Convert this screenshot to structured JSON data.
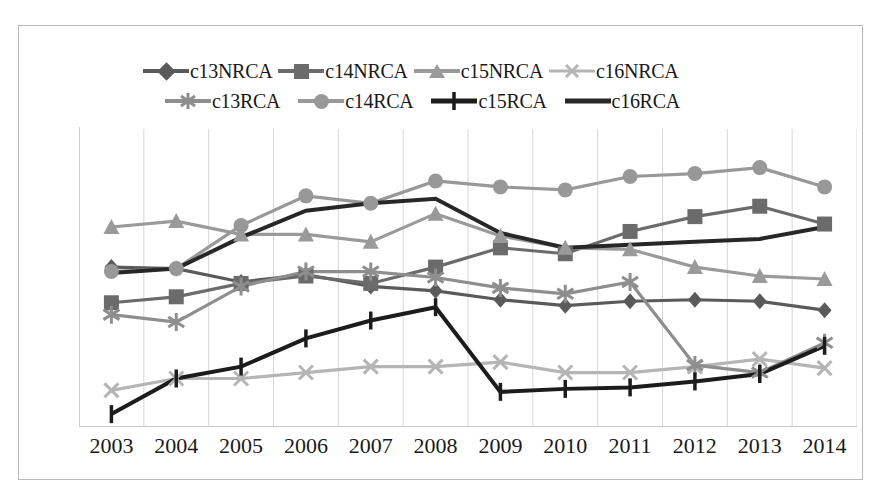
{
  "chart_data": {
    "type": "line",
    "title": "",
    "xlabel": "",
    "ylabel": "",
    "categories": [
      "2003",
      "2004",
      "2005",
      "2006",
      "2007",
      "2008",
      "2009",
      "2010",
      "2011",
      "2012",
      "2013",
      "2014"
    ],
    "ylim": [
      0.5,
      2.5
    ],
    "yticks": [
      0.5,
      1,
      1.5,
      2,
      2.5
    ],
    "ytick_labels": [
      "0.5",
      "1",
      "1.5",
      "2",
      "2.5"
    ],
    "grid": "vertical",
    "legend_position": "top",
    "series": [
      {
        "name": "c13NRCA",
        "marker": "diamond",
        "color": "#5a5a5a",
        "values": [
          1.57,
          1.56,
          1.47,
          1.52,
          1.44,
          1.41,
          1.35,
          1.31,
          1.34,
          1.35,
          1.34,
          1.28
        ]
      },
      {
        "name": "c14NRCA",
        "marker": "square",
        "color": "#6b6b6b",
        "values": [
          1.33,
          1.37,
          1.46,
          1.51,
          1.46,
          1.57,
          1.7,
          1.66,
          1.81,
          1.91,
          1.98,
          1.86
        ]
      },
      {
        "name": "c15NRCA",
        "marker": "triangle",
        "color": "#9a9a9a",
        "values": [
          1.84,
          1.88,
          1.79,
          1.79,
          1.74,
          1.93,
          1.78,
          1.7,
          1.69,
          1.57,
          1.51,
          1.49
        ]
      },
      {
        "name": "c16NRCA",
        "marker": "x",
        "color": "#b5b5b5",
        "values": [
          0.74,
          0.82,
          0.82,
          0.86,
          0.9,
          0.9,
          0.93,
          0.86,
          0.86,
          0.9,
          0.95,
          0.89
        ]
      },
      {
        "name": "c13RCA",
        "marker": "asterisk",
        "color": "#8e8e8e",
        "values": [
          1.25,
          1.2,
          1.44,
          1.54,
          1.54,
          1.5,
          1.43,
          1.39,
          1.47,
          0.91,
          0.86,
          1.06
        ]
      },
      {
        "name": "c14RCA",
        "marker": "circle",
        "color": "#989898",
        "values": [
          1.54,
          1.56,
          1.85,
          2.05,
          2.0,
          2.15,
          2.11,
          2.09,
          2.18,
          2.2,
          2.24,
          2.11
        ]
      },
      {
        "name": "c15RCA",
        "marker": "plus",
        "color": "#1c1c1c",
        "values": [
          0.58,
          0.82,
          0.9,
          1.09,
          1.21,
          1.3,
          0.73,
          0.75,
          0.76,
          0.8,
          0.85,
          1.04
        ]
      },
      {
        "name": "c16RCA",
        "marker": "none",
        "color": "#272727",
        "values": [
          1.53,
          1.56,
          1.77,
          1.95,
          2.0,
          2.03,
          1.8,
          1.7,
          1.72,
          1.74,
          1.76,
          1.84
        ]
      }
    ]
  },
  "legend": {
    "rows": [
      [
        {
          "label": "c13NRCA"
        },
        {
          "label": "c14NRCA"
        },
        {
          "label": "c15NRCA"
        },
        {
          "label": "c16NRCA"
        }
      ],
      [
        {
          "label": "c13RCA"
        },
        {
          "label": "c14RCA"
        },
        {
          "label": "c15RCA"
        },
        {
          "label": "c16RCA"
        }
      ]
    ]
  }
}
